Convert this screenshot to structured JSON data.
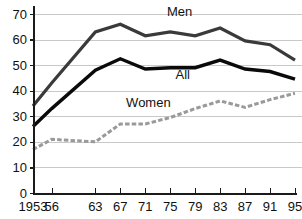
{
  "chart_data": {
    "type": "line",
    "title": "",
    "subtitle": "",
    "xlabel": "",
    "ylabel": "",
    "xlim": [
      1953,
      1995
    ],
    "ylim": [
      0,
      70
    ],
    "grid": "horizontal",
    "legend_position": "inline-annotations",
    "x": [
      1953,
      1956,
      1963,
      1967,
      1971,
      1975,
      1979,
      1983,
      1987,
      1991,
      1995
    ],
    "xtick_labels": [
      "1953",
      "56",
      "63",
      "67",
      "71",
      "75",
      "79",
      "83",
      "87",
      "91",
      "95"
    ],
    "ytick_labels": [
      "0",
      "10",
      "20",
      "30",
      "40",
      "50",
      "60",
      "70"
    ],
    "ytick_values": [
      0,
      10,
      20,
      30,
      40,
      50,
      60,
      70
    ],
    "series": [
      {
        "name": "Men",
        "color": "#3a3a3a",
        "style": "solid",
        "width": 3.2,
        "values": [
          34,
          43,
          63,
          66,
          61.5,
          63,
          61.5,
          64.5,
          59.5,
          58,
          52
        ],
        "label": "Men",
        "label_x": 1976.5,
        "label_y": 69.2
      },
      {
        "name": "All",
        "color": "#0a0a0a",
        "style": "solid",
        "width": 3.4,
        "values": [
          26,
          33,
          48,
          52.5,
          48.5,
          49,
          49,
          52,
          48.5,
          47.5,
          44.5
        ],
        "label": "All",
        "label_x": 1977,
        "label_y": 44.5
      },
      {
        "name": "Women",
        "color": "#9a9a9a",
        "style": "dashed",
        "width": 3.0,
        "values": [
          17,
          21,
          20,
          27,
          27,
          29.5,
          33,
          36,
          33.5,
          36.5,
          39
        ],
        "label": "Women",
        "label_x": 1971.5,
        "label_y": 33.6
      }
    ]
  }
}
